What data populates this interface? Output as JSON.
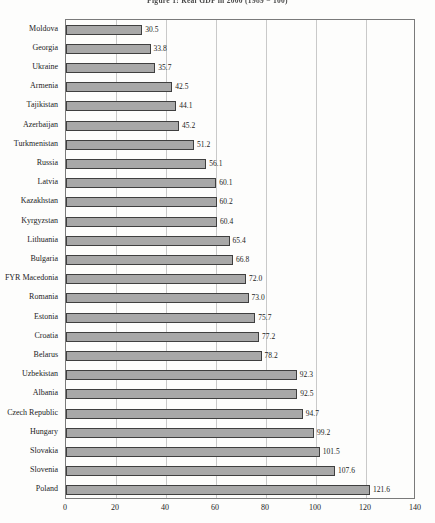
{
  "page": {
    "title": "Figure 1: Real GDP in 2000 (1989 = 100)"
  },
  "chart_data": {
    "type": "bar",
    "orientation": "horizontal",
    "title": "Figure 1: Real GDP in 2000 (1989 = 100)",
    "categories": [
      "Moldova",
      "Georgia",
      "Ukraine",
      "Armenia",
      "Tajikistan",
      "Azerbaijan",
      "Turkmenistan",
      "Russia",
      "Latvia",
      "Kazakhstan",
      "Kyrgyzstan",
      "Lithuania",
      "Bulgaria",
      "FYR Macedonia",
      "Romania",
      "Estonia",
      "Croatia",
      "Belarus",
      "Uzbekistan",
      "Albania",
      "Czech Republic",
      "Hungary",
      "Slovakia",
      "Slovenia",
      "Poland"
    ],
    "values": [
      30.5,
      33.8,
      35.7,
      42.5,
      44.1,
      45.2,
      51.2,
      56.1,
      60.1,
      60.2,
      60.4,
      65.4,
      66.8,
      72.0,
      73.0,
      75.7,
      77.2,
      78.2,
      92.3,
      92.5,
      94.7,
      99.2,
      101.5,
      107.6,
      121.6
    ],
    "value_labels": [
      "30.5",
      "33.8",
      "35.7",
      "42.5",
      "44.1",
      "45.2",
      "51.2",
      "56.1",
      "60.1",
      "60.2",
      "60.4",
      "65.4",
      "66.8",
      "72.0",
      "73.0",
      "75.7",
      "77.2",
      "78.2",
      "92.3",
      "92.5",
      "94.7",
      "99.2",
      "101.5",
      "107.6",
      "121.6"
    ],
    "xlabel": "",
    "ylabel": "",
    "xlim": [
      0,
      140
    ],
    "xticks": [
      "0",
      "20",
      "40",
      "60",
      "80",
      "100",
      "120",
      "140"
    ],
    "grid": "vertical-gridlines-at-xticks",
    "legend": "none",
    "bar_color": "#a8a8a8",
    "bar_border_color": "#3f3f3f",
    "gridline_color": "#c9c9c9"
  }
}
